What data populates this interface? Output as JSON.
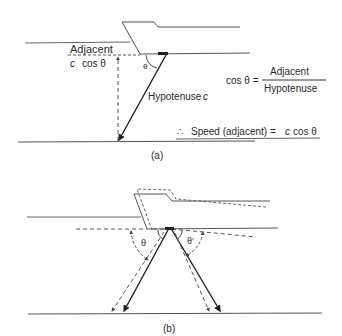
{
  "figure_a": {
    "label": "(a)",
    "adjacent_label": "Adjacent",
    "adjacent_value_c": "c",
    "adjacent_value_cos": "cos θ",
    "angle_label": "θ",
    "hypotenuse_label": "Hypotenuse",
    "hypotenuse_var": "c",
    "formula": {
      "lhs": "cos θ =",
      "numerator": "Adjacent",
      "denominator": "Hypotenuse"
    },
    "conclusion": {
      "therefore": "∴",
      "text": "Speed (adjacent) =",
      "c": "c",
      "cos": "cos θ"
    }
  },
  "figure_b": {
    "label": "(b)",
    "angle_left": "θ",
    "angle_right": "θ′"
  },
  "colors": {
    "stroke": "#2a2a2a",
    "line": "#6a6a6a",
    "background": "#ffffff"
  }
}
